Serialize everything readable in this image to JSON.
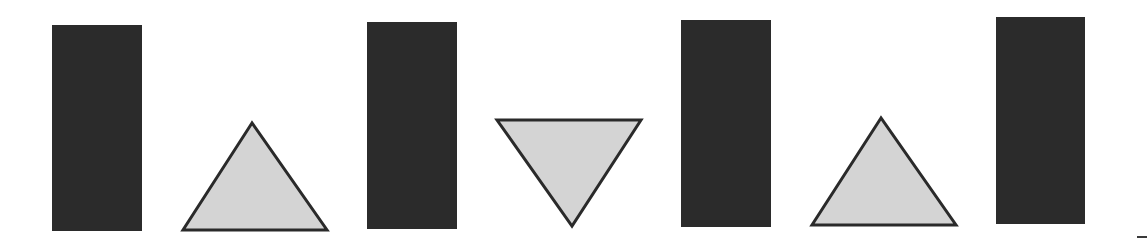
{
  "canvas": {
    "width": 1147,
    "height": 247,
    "background": "#ffffff"
  },
  "colors": {
    "rect_fill": "#2b2b2b",
    "triangle_fill": "#d4d4d4",
    "triangle_stroke": "#2a2a2a",
    "dash": "#3a3a3a"
  },
  "shapes": [
    {
      "type": "rectangle",
      "x": 52,
      "y": 25,
      "w": 90,
      "h": 206
    },
    {
      "type": "triangle-up",
      "points": "252,123 183,230 327,230"
    },
    {
      "type": "rectangle",
      "x": 367,
      "y": 22,
      "w": 90,
      "h": 207
    },
    {
      "type": "triangle-down",
      "points": "497,120 641,120 572,226"
    },
    {
      "type": "rectangle",
      "x": 681,
      "y": 20,
      "w": 90,
      "h": 207
    },
    {
      "type": "triangle-up",
      "points": "881,118 812,225 956,225"
    },
    {
      "type": "rectangle",
      "x": 996,
      "y": 17,
      "w": 89,
      "h": 207
    }
  ],
  "edge_mark": {
    "x": 1137,
    "y": 236,
    "w": 10,
    "h": 2
  }
}
